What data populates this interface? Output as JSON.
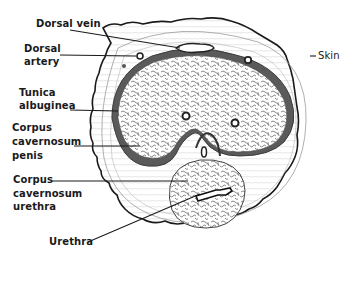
{
  "figure": {
    "type": "anatomical cross-section illustration",
    "labels": [
      {
        "id": "dorsal-vein",
        "text": "Dorsal vein"
      },
      {
        "id": "dorsal-artery",
        "line1": "Dorsal",
        "line2": "artery"
      },
      {
        "id": "skin",
        "text": "Skin"
      },
      {
        "id": "tunica-albuginea",
        "line1": "Tunica",
        "line2": "albuginea"
      },
      {
        "id": "corpus-cavernosum-penis",
        "line1": "Corpus",
        "line2": "cavernosum",
        "line3": "penis"
      },
      {
        "id": "corpus-cavernosum-urethra",
        "line1": "Corpus",
        "line2": "cavernosum",
        "line3": "urethra"
      },
      {
        "id": "urethra",
        "text": "Urethra"
      }
    ],
    "colors": {
      "ink": "#1a1a1a",
      "tissue_dark": "#5a5a5a",
      "tissue_light": "#bdbdbd",
      "background": "#ffffff"
    }
  }
}
